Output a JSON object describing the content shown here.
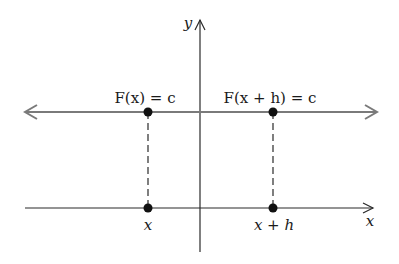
{
  "diagram": {
    "axes": {
      "x_label": "x",
      "y_label": "y"
    },
    "horizontal_line": {
      "description": "y = c",
      "color": "#7a7a7a"
    },
    "points": [
      {
        "top_label": "F(x) = c",
        "bottom_label": "x"
      },
      {
        "top_label": "F(x + h) = c",
        "bottom_label": "x + h"
      }
    ],
    "colors": {
      "axis": "#2a2a2a",
      "line": "#7a7a7a",
      "point": "#111111"
    }
  }
}
